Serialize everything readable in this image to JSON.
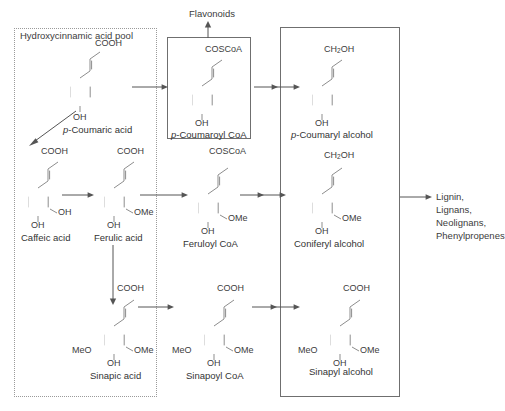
{
  "diagram": {
    "title_pool": "Hydroxycinnamic acid pool",
    "products": [
      "Lignin,",
      "Lignans,",
      "Neolignans,",
      "Phenylpropenes"
    ],
    "flavonoids": "Flavonoids",
    "colors": {
      "bond": "#8d8d8d",
      "arrow": "#555555",
      "text": "#3c3c3c",
      "dotted_border": "#9a9a9a",
      "solid_border": "#6f6f6f",
      "background": "#ffffff"
    }
  },
  "compounds": {
    "p_coumaric_acid": {
      "name": "p-Coumaric acid",
      "name_italic_prefix": "p",
      "name_rest": "-Coumaric acid",
      "top_group": "COOH",
      "para_group": "OH",
      "meta_groups": []
    },
    "p_coumaroyl_coa": {
      "name": "p-Coumaroyl CoA",
      "name_italic_prefix": "p",
      "name_rest": "-Coumaroyl CoA",
      "top_group": "COSCoA",
      "para_group": "OH",
      "meta_groups": []
    },
    "p_coumaryl_alcohol": {
      "name": "p-Coumaryl alcohol",
      "name_italic_prefix": "p",
      "name_rest": "-Coumaryl alcohol",
      "top_group": "CH2OH",
      "top_group_main": "CH",
      "top_group_sub": "2",
      "top_group_tail": "OH",
      "para_group": "OH",
      "meta_groups": []
    },
    "caffeic_acid": {
      "name": "Caffeic acid",
      "top_group": "COOH",
      "para_group": "OH",
      "meta_right": "OH"
    },
    "ferulic_acid": {
      "name": "Ferulic acid",
      "top_group": "COOH",
      "para_group": "OH",
      "meta_right": "OMe"
    },
    "feruloyl_coa": {
      "name": "Feruloyl CoA",
      "top_group": "COSCoA",
      "para_group": "OH",
      "meta_right": "OMe"
    },
    "coniferyl_alcohol": {
      "name": "Coniferyl alcohol",
      "top_group": "CH2OH",
      "top_group_main": "CH",
      "top_group_sub": "2",
      "top_group_tail": "OH",
      "para_group": "OH",
      "meta_right": "OMe"
    },
    "sinapic_acid": {
      "name": "Sinapic acid",
      "top_group": "COOH",
      "para_group": "OH",
      "meta_left": "MeO",
      "meta_right": "OMe"
    },
    "sinapoyl_coa": {
      "name": "Sinapoyl CoA",
      "top_group": "COOH",
      "para_group": "OH",
      "meta_left": "MeO",
      "meta_right": "OMe"
    },
    "sinapyl_alcohol": {
      "name": "Sinapyl alcohol",
      "top_group": "COOH",
      "para_group": "OH",
      "meta_left": "MeO",
      "meta_right": "OMe"
    }
  }
}
